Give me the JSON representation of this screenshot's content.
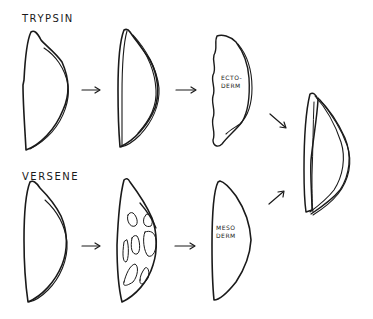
{
  "rows": [
    {
      "label": "TRYPSIN",
      "final_label_line1": "ECTO-",
      "final_label_line2": "DERM"
    },
    {
      "label": "VERSENE",
      "final_label_line1": "MESO",
      "final_label_line2": "DERM"
    }
  ],
  "colors": {
    "ink": "#1a1a1a",
    "background": "#ffffff"
  }
}
